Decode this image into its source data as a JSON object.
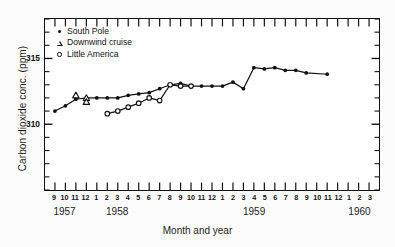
{
  "chart_data": {
    "type": "line",
    "title": "",
    "xlabel": "Month and year",
    "ylabel": "Carbon dioxide conc. (ppm)",
    "ylim": [
      305,
      318
    ],
    "y_major_ticks": [
      310,
      315
    ],
    "y_major_tick_labels": [
      "310",
      "315"
    ],
    "y_minor_tick_step": 1,
    "grid": false,
    "legend_position": "upper-left",
    "x_axis": {
      "unit": "month",
      "range_start": "1957-09",
      "range_end": "1960-03",
      "month_labels": [
        "9",
        "10",
        "11",
        "12",
        "1",
        "2",
        "3",
        "4",
        "5",
        "6",
        "7",
        "8",
        "9",
        "10",
        "11",
        "12",
        "1",
        "2",
        "3",
        "4",
        "5",
        "6",
        "7",
        "8",
        "9",
        "10",
        "11",
        "12",
        "1",
        "2",
        "3"
      ],
      "year_labels": [
        {
          "label": "1957",
          "center_month": "1957-10"
        },
        {
          "label": "1958",
          "center_month": "1958-03"
        },
        {
          "label": "1959",
          "center_month": "1959-04"
        },
        {
          "label": "1960",
          "center_month": "1960-02"
        }
      ]
    },
    "series": [
      {
        "name": "South Pole",
        "marker": "filled-circle",
        "points": [
          {
            "x": "1957-09",
            "y": 311.0
          },
          {
            "x": "1957-10",
            "y": 311.4
          },
          {
            "x": "1957-11",
            "y": 311.9
          },
          {
            "x": "1957-12",
            "y": 312.0
          },
          {
            "x": "1958-01",
            "y": 312.0
          },
          {
            "x": "1958-02",
            "y": 312.0
          },
          {
            "x": "1958-03",
            "y": 312.0
          },
          {
            "x": "1958-04",
            "y": 312.2
          },
          {
            "x": "1958-05",
            "y": 312.3
          },
          {
            "x": "1958-06",
            "y": 312.4
          },
          {
            "x": "1958-07",
            "y": 312.7
          },
          {
            "x": "1958-08",
            "y": 313.0
          },
          {
            "x": "1958-09",
            "y": 313.1
          },
          {
            "x": "1958-10",
            "y": 312.9
          },
          {
            "x": "1958-11",
            "y": 312.9
          },
          {
            "x": "1958-12",
            "y": 312.9
          },
          {
            "x": "1959-01",
            "y": 312.9
          },
          {
            "x": "1959-02",
            "y": 313.2
          },
          {
            "x": "1959-03",
            "y": 312.7
          },
          {
            "x": "1959-04",
            "y": 314.3
          },
          {
            "x": "1959-05",
            "y": 314.2
          },
          {
            "x": "1959-06",
            "y": 314.3
          },
          {
            "x": "1959-07",
            "y": 314.1
          },
          {
            "x": "1959-08",
            "y": 314.1
          },
          {
            "x": "1959-09",
            "y": 313.9
          },
          {
            "x": "1959-11",
            "y": 313.8
          }
        ]
      },
      {
        "name": "Downwind cruise",
        "marker": "open-triangle",
        "points": [
          {
            "x": "1957-11",
            "y": 312.2
          },
          {
            "x": "1957-12",
            "y": 312.0
          },
          {
            "x": "1957-12",
            "y": 311.7
          }
        ]
      },
      {
        "name": "Little America",
        "marker": "open-circle",
        "points": [
          {
            "x": "1958-02",
            "y": 310.8
          },
          {
            "x": "1958-03",
            "y": 311.0
          },
          {
            "x": "1958-04",
            "y": 311.3
          },
          {
            "x": "1958-05",
            "y": 311.6
          },
          {
            "x": "1958-06",
            "y": 312.0
          },
          {
            "x": "1958-07",
            "y": 311.8
          },
          {
            "x": "1958-08",
            "y": 313.0
          },
          {
            "x": "1958-09",
            "y": 312.9
          },
          {
            "x": "1958-10",
            "y": 312.9
          }
        ]
      }
    ]
  },
  "legend": {
    "items": [
      {
        "label": "South Pole",
        "marker": "filled-circle"
      },
      {
        "label": "Downwind cruise",
        "marker": "open-triangle"
      },
      {
        "label": "Little America",
        "marker": "open-circle"
      }
    ]
  },
  "colors": {
    "ink": "#111111",
    "paper": "#ffffff"
  }
}
